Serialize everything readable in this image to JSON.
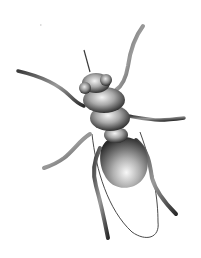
{
  "image": {
    "subject": "insect illustration",
    "description": "Grayscale rendered illustration of a fly-like insect seen from above, with segmented thorax, two round eyes, six long curved legs, one antenna, a rounded abdomen and a thin outlined wing.",
    "background_color": "#ffffff",
    "palette": {
      "dark": "#1e1e1e",
      "mid": "#6e6e6e",
      "light": "#d8d8d8",
      "highlight": "#f4f4f4",
      "wing_outline": "#4a4a4a"
    }
  }
}
